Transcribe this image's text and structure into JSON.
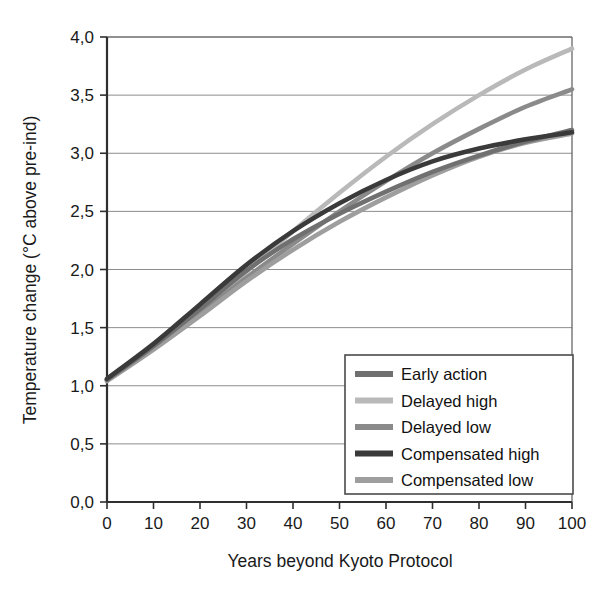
{
  "chart_data": {
    "type": "line",
    "title": "",
    "xlabel": "Years beyond Kyoto Protocol",
    "ylabel": "Temperature change (°C above pre-ind)",
    "xlim": [
      0,
      100
    ],
    "ylim": [
      0.0,
      4.0
    ],
    "grid": true,
    "decimal_separator": ",",
    "legend_position": "bottom-right",
    "xticks": [
      0,
      10,
      20,
      30,
      40,
      50,
      60,
      70,
      80,
      90,
      100
    ],
    "xtick_labels": [
      "0",
      "10",
      "20",
      "30",
      "40",
      "50",
      "60",
      "70",
      "80",
      "90",
      "100"
    ],
    "yticks": [
      0.0,
      0.5,
      1.0,
      1.5,
      2.0,
      2.5,
      3.0,
      3.5,
      4.0
    ],
    "ytick_labels": [
      "0,0",
      "0,5",
      "1,0",
      "1,5",
      "2,0",
      "2,5",
      "3,0",
      "3,5",
      "4,0"
    ],
    "x": [
      0,
      10,
      20,
      30,
      40,
      50,
      60,
      70,
      80,
      90,
      100
    ],
    "series": [
      {
        "name": "Early action",
        "color": "#707070",
        "values": [
          1.05,
          1.34,
          1.66,
          1.99,
          2.26,
          2.48,
          2.67,
          2.84,
          2.98,
          3.1,
          3.2
        ]
      },
      {
        "name": "Delayed high",
        "color": "#b9b9b9",
        "values": [
          1.05,
          1.33,
          1.64,
          1.98,
          2.33,
          2.66,
          2.97,
          3.25,
          3.5,
          3.72,
          3.9
        ]
      },
      {
        "name": "Delayed low",
        "color": "#8a8a8a",
        "values": [
          1.05,
          1.32,
          1.62,
          1.93,
          2.22,
          2.5,
          2.76,
          3.0,
          3.21,
          3.4,
          3.55
        ]
      },
      {
        "name": "Compensated high",
        "color": "#3a3a3a",
        "values": [
          1.06,
          1.36,
          1.7,
          2.04,
          2.33,
          2.57,
          2.77,
          2.93,
          3.04,
          3.12,
          3.18
        ]
      },
      {
        "name": "Compensated low",
        "color": "#9e9e9e",
        "values": [
          1.04,
          1.31,
          1.6,
          1.9,
          2.17,
          2.41,
          2.62,
          2.81,
          2.97,
          3.09,
          3.17
        ]
      }
    ]
  },
  "axes": {
    "x_title": "Years beyond Kyoto Protocol",
    "y_title": "Temperature change (°C above pre-ind)"
  },
  "legend": {
    "items": [
      {
        "label": "Early action",
        "color": "#707070"
      },
      {
        "label": "Delayed high",
        "color": "#b9b9b9"
      },
      {
        "label": "Delayed low",
        "color": "#8a8a8a"
      },
      {
        "label": "Compensated high",
        "color": "#3a3a3a"
      },
      {
        "label": "Compensated low",
        "color": "#9e9e9e"
      }
    ]
  },
  "style": {
    "axis_color": "#4a4a4a",
    "grid_color": "#8d8d8d",
    "text_color": "#1a1a1a",
    "background": "#ffffff"
  }
}
